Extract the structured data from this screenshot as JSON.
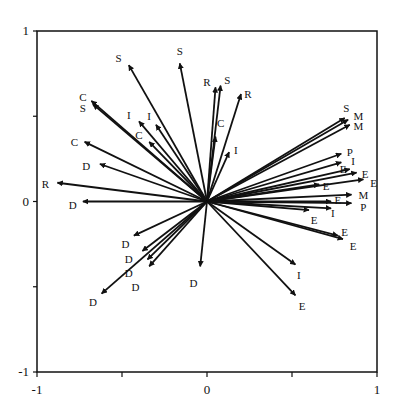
{
  "chart_data": {
    "type": "scatter",
    "subtype": "vector-biplot",
    "title": "",
    "xlabel": "",
    "ylabel": "",
    "xlim": [
      -1,
      1
    ],
    "ylim": [
      -1,
      1
    ],
    "grid": false,
    "legend": null,
    "x_ticks": [
      {
        "value": -1,
        "label": "-1"
      },
      {
        "value": 0,
        "label": "0"
      },
      {
        "value": 1,
        "label": "1"
      }
    ],
    "x_minor_ticks": [
      -0.5,
      0.5
    ],
    "y_ticks": [
      {
        "value": 1,
        "label": "1"
      },
      {
        "value": 0,
        "label": "0"
      },
      {
        "value": -1,
        "label": "-1"
      }
    ],
    "y_minor_ticks": [
      0.5,
      -0.5
    ],
    "origin": [
      0,
      0
    ],
    "vectors": [
      {
        "label": "S",
        "x": -0.46,
        "y": 0.8,
        "lx": -0.52,
        "ly": 0.84
      },
      {
        "label": "S",
        "x": -0.16,
        "y": 0.81,
        "lx": -0.16,
        "ly": 0.88
      },
      {
        "label": "R",
        "x": 0.05,
        "y": 0.67,
        "lx": 0.0,
        "ly": 0.7
      },
      {
        "label": "S",
        "x": 0.08,
        "y": 0.68,
        "lx": 0.12,
        "ly": 0.71
      },
      {
        "label": "R",
        "x": 0.2,
        "y": 0.63,
        "lx": 0.24,
        "ly": 0.63
      },
      {
        "label": "C",
        "x": 0.05,
        "y": 0.38,
        "lx": 0.08,
        "ly": 0.46
      },
      {
        "label": "I",
        "x": 0.13,
        "y": 0.29,
        "lx": 0.17,
        "ly": 0.3
      },
      {
        "label": "C",
        "x": -0.68,
        "y": 0.59,
        "lx": -0.73,
        "ly": 0.61
      },
      {
        "label": "S",
        "x": -0.67,
        "y": 0.57,
        "lx": -0.73,
        "ly": 0.55
      },
      {
        "label": "I",
        "x": -0.4,
        "y": 0.47,
        "lx": -0.46,
        "ly": 0.51
      },
      {
        "label": "I",
        "x": -0.3,
        "y": 0.45,
        "lx": -0.34,
        "ly": 0.5
      },
      {
        "label": "C",
        "x": -0.34,
        "y": 0.35,
        "lx": -0.4,
        "ly": 0.39
      },
      {
        "label": "C",
        "x": -0.72,
        "y": 0.35,
        "lx": -0.78,
        "ly": 0.35
      },
      {
        "label": "D",
        "x": -0.63,
        "y": 0.22,
        "lx": -0.71,
        "ly": 0.21
      },
      {
        "label": "R",
        "x": -0.88,
        "y": 0.11,
        "lx": -0.95,
        "ly": 0.1
      },
      {
        "label": "D",
        "x": -0.73,
        "y": 0.0,
        "lx": -0.79,
        "ly": -0.02
      },
      {
        "label": "S",
        "x": 0.81,
        "y": 0.49,
        "lx": 0.82,
        "ly": 0.55
      },
      {
        "label": "M",
        "x": 0.83,
        "y": 0.48,
        "lx": 0.89,
        "ly": 0.5
      },
      {
        "label": "M",
        "x": 0.84,
        "y": 0.45,
        "lx": 0.89,
        "ly": 0.44
      },
      {
        "label": "P",
        "x": 0.79,
        "y": 0.28,
        "lx": 0.84,
        "ly": 0.29
      },
      {
        "label": "I",
        "x": 0.79,
        "y": 0.23,
        "lx": 0.86,
        "ly": 0.24
      },
      {
        "label": "E",
        "x": 0.84,
        "y": 0.19,
        "lx": 0.8,
        "ly": 0.19
      },
      {
        "label": "E",
        "x": 0.88,
        "y": 0.17,
        "lx": 0.93,
        "ly": 0.16
      },
      {
        "label": "E",
        "x": 0.92,
        "y": 0.13,
        "lx": 0.98,
        "ly": 0.11
      },
      {
        "label": "E",
        "x": 0.66,
        "y": 0.1,
        "lx": 0.7,
        "ly": 0.09
      },
      {
        "label": "M",
        "x": 0.85,
        "y": 0.04,
        "lx": 0.92,
        "ly": 0.04
      },
      {
        "label": "E",
        "x": 0.73,
        "y": 0.0,
        "lx": 0.77,
        "ly": 0.01
      },
      {
        "label": "P",
        "x": 0.85,
        "y": -0.01,
        "lx": 0.92,
        "ly": -0.03
      },
      {
        "label": "E",
        "x": 0.6,
        "y": -0.05,
        "lx": 0.63,
        "ly": -0.11
      },
      {
        "label": "I",
        "x": 0.73,
        "y": -0.04,
        "lx": 0.74,
        "ly": -0.07
      },
      {
        "label": "E",
        "x": 0.77,
        "y": -0.2,
        "lx": 0.81,
        "ly": -0.18
      },
      {
        "label": "E",
        "x": 0.8,
        "y": -0.22,
        "lx": 0.86,
        "ly": -0.26
      },
      {
        "label": "I",
        "x": 0.52,
        "y": -0.37,
        "lx": 0.54,
        "ly": -0.43
      },
      {
        "label": "E",
        "x": 0.52,
        "y": -0.55,
        "lx": 0.56,
        "ly": -0.61
      },
      {
        "label": "D",
        "x": -0.04,
        "y": -0.38,
        "lx": -0.08,
        "ly": -0.48
      },
      {
        "label": "D",
        "x": -0.43,
        "y": -0.2,
        "lx": -0.48,
        "ly": -0.25
      },
      {
        "label": "D",
        "x": -0.38,
        "y": -0.29,
        "lx": -0.46,
        "ly": -0.34
      },
      {
        "label": "D",
        "x": -0.34,
        "y": -0.38,
        "lx": -0.46,
        "ly": -0.42
      },
      {
        "label": "D",
        "x": -0.35,
        "y": -0.34,
        "lx": -0.42,
        "ly": -0.5
      },
      {
        "label": "D",
        "x": -0.62,
        "y": -0.54,
        "lx": -0.67,
        "ly": -0.59
      }
    ]
  }
}
